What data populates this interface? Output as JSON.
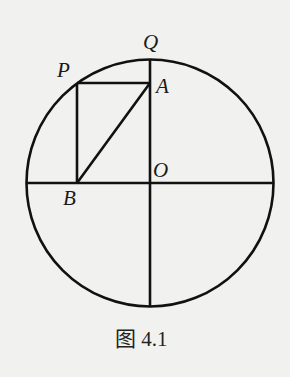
{
  "figure": {
    "caption": "图 4.1",
    "labels": {
      "Q": "Q",
      "P": "P",
      "A": "A",
      "O": "O",
      "B": "B"
    },
    "geometry": {
      "center": [
        150,
        183
      ],
      "radius": 124,
      "points": {
        "O": [
          150,
          183
        ],
        "Q": [
          150,
          59
        ],
        "P": [
          77,
          83
        ],
        "A": [
          150,
          83
        ],
        "B": [
          77,
          183
        ]
      },
      "segments": [
        [
          "P",
          "A"
        ],
        [
          "P",
          "B"
        ],
        [
          "A",
          "B"
        ],
        [
          "Q",
          "bottom"
        ],
        [
          "left",
          "right"
        ]
      ]
    },
    "stroke_color": "#111111",
    "background_color": "#f1f1ef"
  }
}
